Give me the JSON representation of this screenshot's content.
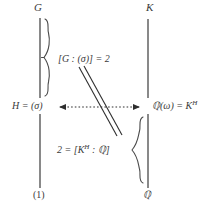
{
  "diagram": {
    "background_color": "#ffffff",
    "ink_color": "#3a3a3a",
    "nodes": {
      "top_left": "G",
      "top_right": "K",
      "middle_left": "H = (σ)",
      "middle_right_base": "ℚ(ω) = K",
      "middle_right_exponent": "H",
      "bottom_left": "(1)",
      "bottom_right": "ℚ"
    },
    "labels": {
      "index_top": "[G : (σ)] = 2",
      "index_bottom_prefix": "2 = [K",
      "index_bottom_exponent": "H",
      "index_bottom_suffix": " : ℚ]"
    },
    "connectors": {
      "correspondence_arrow": "double-headed-dotted-arrow",
      "diagonal": "double-line-slash",
      "left_upper_edge": "vertical-line",
      "left_lower_edge": "vertical-line",
      "right_upper_edge": "vertical-line",
      "right_lower_edge": "vertical-line",
      "upper_brace": "right-pointing-curly-brace",
      "lower_brace": "left-pointing-curly-brace"
    }
  }
}
